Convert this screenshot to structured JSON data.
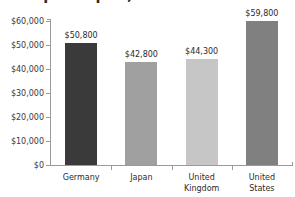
{
  "chart_data": {
    "type": "bar",
    "title": "GDP per Capita, 201",
    "xlabel": "",
    "ylabel": "",
    "categories": [
      "Germany",
      "Japan",
      "United Kingdom",
      "United States"
    ],
    "values": [
      50800,
      42800,
      44300,
      59800
    ],
    "value_labels": [
      "$50,800",
      "$42,800",
      "$44,300",
      "$59,800"
    ],
    "bar_colors": [
      "#3a3a3a",
      "#a0a0a0",
      "#c6c6c6",
      "#808080"
    ],
    "ylim": [
      0,
      60000
    ],
    "ytick_values": [
      0,
      10000,
      20000,
      30000,
      40000,
      50000,
      60000
    ],
    "ytick_labels": [
      "$0",
      "$10,000",
      "$20,000",
      "$30,000",
      "$40,000",
      "$50,000",
      "$60,000"
    ],
    "grid": false,
    "legend": null,
    "axis_color": "#9a9a9a",
    "text_color": "#2b2b2b"
  },
  "category_label_lines": [
    [
      "Germany"
    ],
    [
      "Japan"
    ],
    [
      "United",
      "Kingdom"
    ],
    [
      "United",
      "States"
    ]
  ]
}
